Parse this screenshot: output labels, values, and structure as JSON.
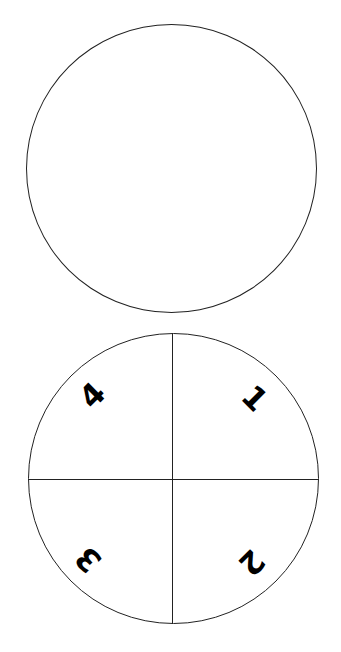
{
  "diagram": {
    "top_circle": {
      "label": "empty circle"
    },
    "bottom_circle": {
      "label": "circle divided into four quadrants",
      "quadrants": [
        {
          "id": "top-right",
          "number": "1"
        },
        {
          "id": "bottom-right",
          "number": "2"
        },
        {
          "id": "bottom-left",
          "number": "3"
        },
        {
          "id": "top-left",
          "number": "4"
        }
      ]
    }
  }
}
